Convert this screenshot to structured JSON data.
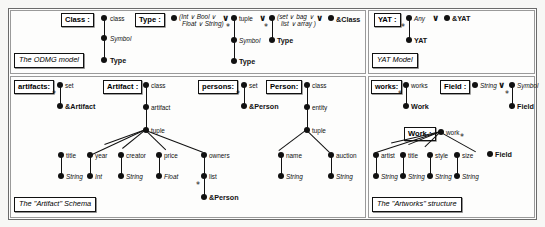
{
  "figure": {
    "background": "#f7f7f5",
    "ink": "#111111"
  },
  "symbols": {
    "or": "∨",
    "star": "*"
  },
  "panels": [
    {
      "id": "odmg",
      "caption": "The ODMG model"
    },
    {
      "id": "yat",
      "caption": "YAT Model"
    },
    {
      "id": "artifact",
      "caption": "The \"Artifact\" Schema"
    },
    {
      "id": "artworks",
      "caption": "The \"Artworks\" structure"
    }
  ],
  "odmg": {
    "caption": "The ODMG model",
    "class_box": "Class :",
    "type_box": "Type :",
    "class_tree": {
      "root_label": "class",
      "mid_label": "Symbol",
      "leaf_label": "Type"
    },
    "type_tree": {
      "scalar_label_line1": "(Int ∨ Bool ∨",
      "scalar_label_line2": "Float ∨ String)",
      "tuple_label": "tuple",
      "tuple_star": "*",
      "tuple_child1": "Symbol",
      "tuple_child2": "Type",
      "coll_label_line1": "(set ∨ bag ∨",
      "coll_label_line2": "list ∨ array )",
      "coll_star": "*",
      "coll_child": "Type",
      "ref_label": "&Class",
      "or1": "∨",
      "or2": "∨",
      "or3": "∨"
    }
  },
  "yat": {
    "caption": "YAT Model",
    "yat_box": "YAT :",
    "any_label": "Any",
    "or": "∨",
    "ref_label": "&YAT",
    "star": "*",
    "child_label": "YAT"
  },
  "artifact": {
    "caption": "The \"Artifact\" Schema",
    "artifacts_box": "artifacts:",
    "artifacts_root": "set",
    "artifacts_star": "*",
    "artifacts_leaf": "&Artifact",
    "artifact_box": "Artifact :",
    "artifact_root": "class",
    "artifact_mid": "artifact",
    "artifact_tuple": "tuple",
    "fields": [
      {
        "name": "title",
        "type": "String"
      },
      {
        "name": "year",
        "type": "Int"
      },
      {
        "name": "creator",
        "type": "String"
      },
      {
        "name": "price",
        "type": "Float"
      }
    ],
    "owners_label": "owners",
    "owners_list": "list",
    "owners_star": "*",
    "owners_leaf": "&Person",
    "persons_box": "persons:",
    "persons_root": "set",
    "persons_star": "*",
    "persons_leaf": "&Person",
    "person_box": "Person:",
    "person_root": "class",
    "person_mid": "entity",
    "person_tuple": "tuple",
    "person_fields": [
      {
        "name": "name",
        "type": "String"
      },
      {
        "name": "auction",
        "type": "String"
      }
    ]
  },
  "artworks": {
    "caption": "The \"Artworks\" structure",
    "works_box": "works:",
    "works_root": "works",
    "works_star": "*",
    "works_leaf": "Work",
    "field_box": "Field :",
    "field_string": "String",
    "field_or": "∨",
    "field_symbol": "Symbol",
    "field_star": "*",
    "field_leaf": "Field",
    "work_box": "Work :",
    "work_root": "work",
    "work_star": "*",
    "work_field_leaf": "Field",
    "work_fields": [
      {
        "name": "artist",
        "type": "String"
      },
      {
        "name": "title",
        "type": "String"
      },
      {
        "name": "style",
        "type": "String"
      },
      {
        "name": "size",
        "type": "String"
      }
    ]
  }
}
